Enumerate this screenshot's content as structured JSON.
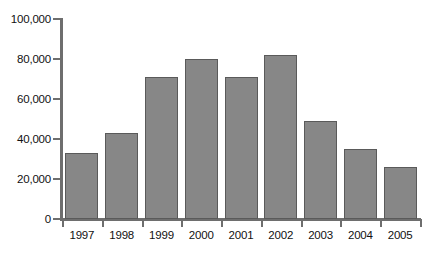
{
  "chart_data": {
    "type": "bar",
    "title": "",
    "subtitle": "",
    "xlabel": "",
    "ylabel": "",
    "categories": [
      "1997",
      "1998",
      "1999",
      "2000",
      "2001",
      "2002",
      "2003",
      "2004",
      "2005"
    ],
    "values": [
      33000,
      43000,
      71000,
      80000,
      71000,
      82000,
      49000,
      35000,
      26000
    ],
    "ylim": [
      0,
      100000
    ],
    "ytick_values": [
      0,
      20000,
      40000,
      60000,
      80000,
      100000
    ],
    "ytick_labels": [
      "0",
      "20,000",
      "40,000",
      "60,000",
      "80,000",
      "100,000"
    ],
    "grid": false,
    "legend": null,
    "annotations": [],
    "colors": {
      "bar_fill": "#878787",
      "bar_edge": "#5a5a5a",
      "axis": "#6e6e6e",
      "text": "#111111",
      "background": "#ffffff"
    },
    "bar_style": "dotted-stipple-gray"
  }
}
